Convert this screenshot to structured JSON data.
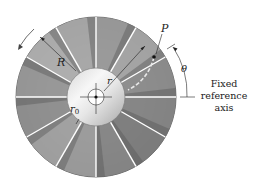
{
  "figure": {
    "type": "rotating-disk-with-radial-vanes",
    "vane_count": 12,
    "labels": {
      "outer_radius": "R",
      "point": "P",
      "radius": "r",
      "hub_radius_base": "r",
      "hub_radius_sub": "0",
      "angle": "θ",
      "axis_line1": "Fixed",
      "axis_line2": "reference",
      "axis_line3": "axis"
    },
    "colors": {
      "disk_dark": "#6e6e6e",
      "disk_light": "#c9c9c9",
      "hub_light": "#f2f2f2",
      "hub_dark": "#b5b5b5",
      "vane": "#ffffff",
      "ink": "#222222",
      "dashed_arc": "#e8e8e8"
    },
    "rotation_direction": "counterclockwise"
  }
}
